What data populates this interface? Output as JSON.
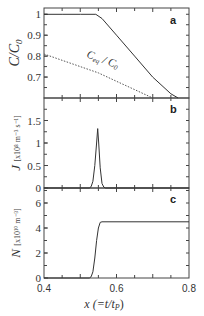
{
  "chart_data": [
    {
      "panel": "a",
      "type": "line",
      "ylabel": "C/C0",
      "ylabel_main": "C/C",
      "ylabel_sub": "0",
      "xlim": [
        0.4,
        0.8
      ],
      "ylim": [
        0.6,
        1.03
      ],
      "yticks": [
        1,
        0.9,
        0.8,
        0.7
      ],
      "ytick_labels": [
        "1",
        "0.9",
        "0.8",
        "0.7"
      ],
      "series": [
        {
          "name": "C/C0",
          "style": "solid",
          "x": [
            0.4,
            0.45,
            0.5,
            0.543,
            0.56,
            0.6,
            0.65,
            0.7,
            0.75,
            0.77
          ],
          "y": [
            1.0,
            1.0,
            1.0,
            1.0,
            0.98,
            0.9,
            0.8,
            0.7,
            0.62,
            0.6
          ]
        },
        {
          "name": "Ceq/C0",
          "style": "dotted",
          "annotation_main": "C",
          "annotation_sub1": "eq",
          "annotation_mid": " / C",
          "annotation_sub2": "0",
          "x": [
            0.4,
            0.45,
            0.5,
            0.55,
            0.6,
            0.65,
            0.7
          ],
          "y": [
            0.81,
            0.78,
            0.75,
            0.72,
            0.68,
            0.64,
            0.6
          ]
        }
      ]
    },
    {
      "panel": "b",
      "type": "line",
      "ylabel": "J [x10^8 m^-3 s^-1]",
      "ylabel_main": "J",
      "ylabel_unit": "[x10⁸ m⁻³ s⁻¹]",
      "xlim": [
        0.4,
        0.8
      ],
      "ylim": [
        0,
        2.0
      ],
      "yticks": [
        1.5,
        1,
        0.5,
        0
      ],
      "ytick_labels": [
        "1.5",
        "1",
        "0.5",
        "0"
      ],
      "series": [
        {
          "name": "J",
          "style": "solid",
          "x": [
            0.4,
            0.525,
            0.53,
            0.535,
            0.54,
            0.545,
            0.548,
            0.551,
            0.555,
            0.56,
            0.565,
            0.57,
            0.8
          ],
          "y": [
            0,
            0,
            0.03,
            0.15,
            0.5,
            1.0,
            1.32,
            1.0,
            0.45,
            0.1,
            0.02,
            0,
            0
          ]
        }
      ]
    },
    {
      "panel": "c",
      "type": "line",
      "ylabel": "N [x10^10 m^-3]",
      "ylabel_main": "N",
      "ylabel_unit": "[x10¹⁰ m⁻³]",
      "xlabel": "x (=t/tP)",
      "xlim": [
        0.4,
        0.8
      ],
      "ylim": [
        0,
        7.2
      ],
      "yticks": [
        6,
        4,
        2,
        0
      ],
      "ytick_labels": [
        "6",
        "4",
        "2",
        "0"
      ],
      "xticks": [
        0.4,
        0.6,
        0.8
      ],
      "xtick_labels": [
        "0.4",
        "0.6",
        "0.8"
      ],
      "series": [
        {
          "name": "N",
          "style": "solid",
          "x": [
            0.4,
            0.525,
            0.53,
            0.535,
            0.54,
            0.545,
            0.55,
            0.555,
            0.56,
            0.8
          ],
          "y": [
            0,
            0,
            0.1,
            0.5,
            1.6,
            3.0,
            4.0,
            4.45,
            4.5,
            4.5
          ]
        }
      ]
    }
  ],
  "labels": {
    "panel_a": "a",
    "panel_b": "b",
    "panel_c": "c",
    "xlabel_main": "x (=t/t",
    "xlabel_sub": "P",
    "xlabel_end": ")"
  },
  "grid": false,
  "legend": "none"
}
